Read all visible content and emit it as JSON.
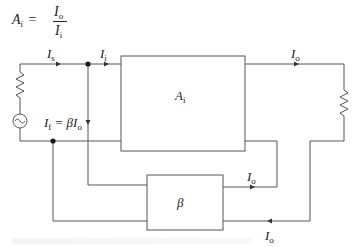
{
  "equation": {
    "lhs_symbol": "A",
    "lhs_sub": "i",
    "equals": "=",
    "numerator_symbol": "I",
    "numerator_sub": "o",
    "denominator_symbol": "I",
    "denominator_sub": "i"
  },
  "labels": {
    "source_current": {
      "symbol": "I",
      "sub": "s"
    },
    "input_current": {
      "symbol": "I",
      "sub": "i"
    },
    "output_current_top": {
      "symbol": "I",
      "sub": "o"
    },
    "feedback_current": {
      "symbol": "I",
      "sub": "f",
      "rhs": "= βI",
      "rhs_sub": "o"
    },
    "amplifier_block": {
      "symbol": "A",
      "sub": "i"
    },
    "feedback_block": {
      "symbol": "β"
    },
    "feedback_output_upper": {
      "symbol": "I",
      "sub": "o"
    },
    "feedback_output_lower": {
      "symbol": "I",
      "sub": "o"
    }
  },
  "colors": {
    "wire": "#555555",
    "dot": "#1a1a1a",
    "text": "#222222"
  }
}
